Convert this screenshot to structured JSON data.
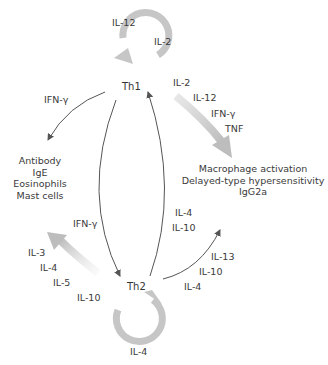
{
  "nodes": {
    "th1": "Th1",
    "th2": "Th2"
  },
  "th1_autocrine": {
    "labels": [
      "IL-12",
      "IL-2"
    ]
  },
  "th2_autocrine": {
    "labels": [
      "IL-4"
    ]
  },
  "th1_to_macrophage": {
    "labels": [
      "IL-2",
      "IL-12",
      "IFN-γ",
      "TNF"
    ]
  },
  "th1_to_antibody": {
    "labels": [
      "IFN-γ"
    ]
  },
  "th1_to_th2": {
    "labels": [
      "IFN-γ"
    ]
  },
  "th2_to_th1": {
    "labels": [
      "IL-4",
      "IL-10"
    ]
  },
  "th2_to_antibody": {
    "labels": [
      "IL-3",
      "IL-4",
      "IL-5",
      "IL-10"
    ]
  },
  "th2_to_macrophage": {
    "labels": [
      "IL-13",
      "IL-10",
      "IL-4"
    ]
  },
  "outcomes": {
    "th2_effects": [
      "Antibody",
      "IgE",
      "Eosinophils",
      "Mast cells"
    ],
    "th1_effects": [
      "Macrophage activation",
      "Delayed-type hypersensitivity",
      "IgG2a"
    ]
  },
  "colors": {
    "thick_arrow": "#c8c8c8",
    "thin_arrow": "#555555",
    "text": "#3a3a3a"
  }
}
